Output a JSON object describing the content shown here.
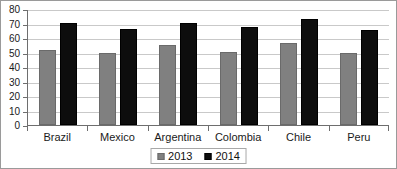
{
  "chart_data": {
    "type": "bar",
    "title": "",
    "xlabel": "",
    "ylabel": "",
    "ylim": [
      0,
      80
    ],
    "ytick_step": 10,
    "yticks": [
      "80",
      "70",
      "60",
      "50",
      "40",
      "30",
      "20",
      "10",
      "0"
    ],
    "grid": true,
    "legend_position": "bottom",
    "categories": [
      "Brazil",
      "Mexico",
      "Argentina",
      "Colombia",
      "Chile",
      "Peru"
    ],
    "series": [
      {
        "name": "2013",
        "color": "#808080",
        "values": [
          52,
          50,
          56,
          51,
          57,
          50
        ]
      },
      {
        "name": "2014",
        "color": "#0d0d0d",
        "values": [
          71,
          67,
          71,
          68,
          74,
          66
        ]
      }
    ]
  },
  "legend": {
    "items": [
      {
        "label": "2013"
      },
      {
        "label": "2014"
      }
    ]
  }
}
